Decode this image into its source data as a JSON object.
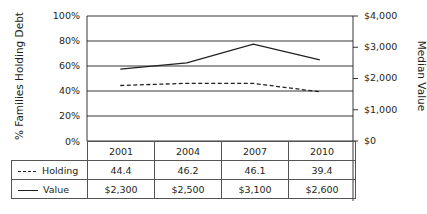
{
  "chart_data": {
    "type": "line",
    "title": "",
    "categories": [
      "2001",
      "2004",
      "2007",
      "2010"
    ],
    "series": [
      {
        "name": "Holding",
        "axis": "left",
        "style": "dashed",
        "values": [
          44.4,
          46.2,
          46.1,
          39.4
        ]
      },
      {
        "name": "Value",
        "axis": "right",
        "style": "solid",
        "values": [
          2300,
          2500,
          3100,
          2600
        ]
      }
    ],
    "ylabel": "% Families Holding Debt",
    "ylabel_right": "Median Value",
    "ylim": [
      0,
      100
    ],
    "ylim_right": [
      0,
      4000
    ],
    "yticks": [
      "100%",
      "80%",
      "60%",
      "40%",
      "20%",
      "0%"
    ],
    "yticks_right": [
      "$4,000",
      "$3,000",
      "$2,000",
      "$1,000",
      "$0"
    ],
    "grid": true,
    "legend_position": "data-table"
  },
  "axes": {
    "left_label": "% Families Holding Debt",
    "right_label": "Median Value",
    "left_ticks": [
      "100%",
      "80%",
      "60%",
      "40%",
      "20%",
      "0%"
    ],
    "right_ticks": [
      "$4,000",
      "$3,000",
      "$2,000",
      "$1,000",
      "$0"
    ]
  },
  "table": {
    "years": [
      "2001",
      "2004",
      "2007",
      "2010"
    ],
    "rows": [
      {
        "label": "Holding",
        "cells": [
          "44.4",
          "46.2",
          "46.1",
          "39.4"
        ]
      },
      {
        "label": "Value",
        "cells": [
          "$2,300",
          "$2,500",
          "$3,100",
          "$2,600"
        ]
      }
    ]
  }
}
